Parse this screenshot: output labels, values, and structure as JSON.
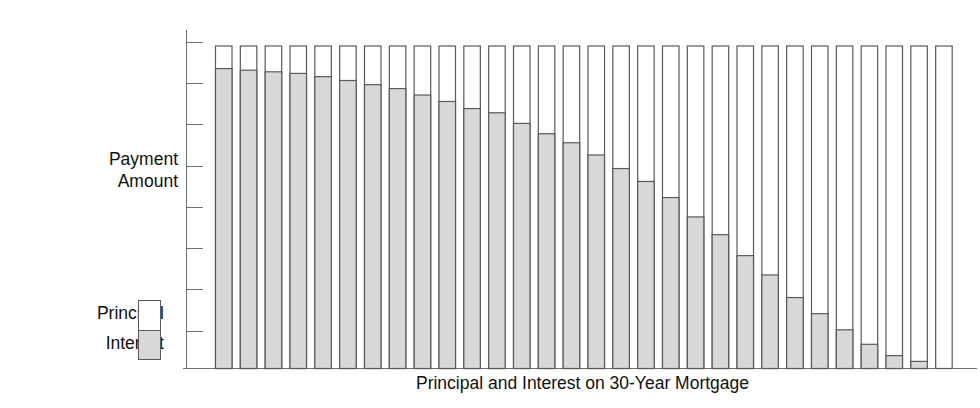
{
  "chart_data": {
    "type": "bar",
    "stacked": true,
    "title": "",
    "xlabel": "Principal and Interest on 30-Year Mortgage",
    "ylabel": "Payment\nAmount",
    "grid": false,
    "legend_position": "left",
    "y_axis": {
      "tick_count": 8,
      "tick_labels": [],
      "ylim": [
        0,
        1.0
      ],
      "note": "Axis ticks unlabeled; values are fractions of the constant total payment."
    },
    "categories": [
      "1",
      "2",
      "3",
      "4",
      "5",
      "6",
      "7",
      "8",
      "9",
      "10",
      "11",
      "12",
      "13",
      "14",
      "15",
      "16",
      "17",
      "18",
      "19",
      "20",
      "21",
      "22",
      "23",
      "24",
      "25",
      "26",
      "27",
      "28",
      "29",
      "30"
    ],
    "series": [
      {
        "name": "Interest",
        "color": "#d8d8d8",
        "values": [
          0.93,
          0.925,
          0.92,
          0.915,
          0.905,
          0.893,
          0.88,
          0.868,
          0.848,
          0.828,
          0.806,
          0.793,
          0.76,
          0.728,
          0.7,
          0.662,
          0.62,
          0.58,
          0.53,
          0.47,
          0.415,
          0.35,
          0.29,
          0.22,
          0.17,
          0.12,
          0.075,
          0.04,
          0.022,
          0.0
        ]
      },
      {
        "name": "Principal",
        "color": "#ffffff",
        "values": [
          0.07,
          0.075,
          0.08,
          0.085,
          0.095,
          0.107,
          0.12,
          0.132,
          0.152,
          0.172,
          0.194,
          0.207,
          0.24,
          0.272,
          0.3,
          0.338,
          0.38,
          0.42,
          0.47,
          0.53,
          0.585,
          0.65,
          0.71,
          0.78,
          0.83,
          0.88,
          0.925,
          0.96,
          0.978,
          1.0
        ]
      }
    ]
  },
  "legend": {
    "principal_label": "Principal",
    "interest_label": "Interest"
  },
  "axis": {
    "y_label": "Payment\nAmount",
    "x_label": "Principal and Interest on 30-Year Mortgage"
  },
  "colors": {
    "interest_fill": "#d8d8d8",
    "principal_fill": "#ffffff",
    "bar_stroke": "#5a5a5a",
    "axis_stroke": "#6e6e6e",
    "text": "#101010"
  }
}
